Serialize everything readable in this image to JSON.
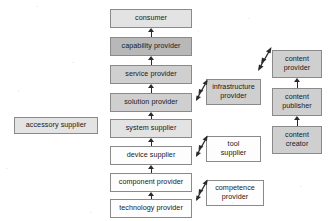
{
  "diagram": {
    "type": "block-flow-diagram",
    "colors": {
      "fill_dark": "#b8b8b8",
      "fill_mid": "#cfcfcf",
      "fill_light": "#e3e3e3",
      "fill_none": "#fdfdfd",
      "border": "#8a8a8a",
      "arrow": "#2b2b2b",
      "background": "#ffffff"
    },
    "main_chain": {
      "name": "main-value-chain",
      "direction": "bottom-to-top",
      "nodes": [
        {
          "id": "consumer",
          "label": "consumer",
          "shade": "light"
        },
        {
          "id": "capability-provider",
          "label": "capability provider",
          "shade": "dark"
        },
        {
          "id": "service-provider",
          "label": "service provider",
          "shade": "mid"
        },
        {
          "id": "solution-provider",
          "label": "solution provider",
          "shade": "mid"
        },
        {
          "id": "system-supplier",
          "label": "system supplier",
          "shade": "light"
        },
        {
          "id": "device-supplier",
          "label": "device supplier",
          "shade": "none"
        },
        {
          "id": "component-provider",
          "label": "component provider",
          "shade": "none"
        },
        {
          "id": "technology-provider",
          "label": "technology provider",
          "shade": "none"
        }
      ]
    },
    "content_chain": {
      "name": "content-value-chain",
      "direction": "bottom-to-top",
      "nodes": [
        {
          "id": "content-provider",
          "label": "content\nprovider",
          "shade": "mid"
        },
        {
          "id": "content-publisher",
          "label": "content\npublisher",
          "shade": "mid"
        },
        {
          "id": "content-creator",
          "label": "content\ncreator",
          "shade": "mid"
        }
      ]
    },
    "side_nodes": [
      {
        "id": "accessory-supplier",
        "label": "accessory supplier",
        "shade": "light"
      },
      {
        "id": "infrastructure-provider",
        "label": "infrastructure\nprovider",
        "shade": "mid"
      },
      {
        "id": "tool-supplier",
        "label": "tool\nsupplier",
        "shade": "none"
      },
      {
        "id": "competence-provider",
        "label": "competence\nprovider",
        "shade": "none"
      }
    ],
    "connectors": [
      {
        "id": "arrow-technology-to-component",
        "kind": "vertical-up"
      },
      {
        "id": "arrow-component-to-device",
        "kind": "vertical-up"
      },
      {
        "id": "arrow-device-to-system",
        "kind": "vertical-up"
      },
      {
        "id": "arrow-system-to-solution",
        "kind": "vertical-up"
      },
      {
        "id": "arrow-solution-to-service",
        "kind": "vertical-up"
      },
      {
        "id": "arrow-service-to-capability",
        "kind": "vertical-up"
      },
      {
        "id": "arrow-capability-to-consumer",
        "kind": "vertical-up"
      },
      {
        "id": "arrow-creator-to-publisher",
        "kind": "vertical-up"
      },
      {
        "id": "arrow-publisher-to-provider",
        "kind": "vertical-up"
      },
      {
        "id": "arrow-infrastructure-diagonal",
        "kind": "diagonal-double"
      },
      {
        "id": "arrow-tool-diagonal",
        "kind": "diagonal-double"
      },
      {
        "id": "arrow-competence-diagonal",
        "kind": "diagonal-double"
      },
      {
        "id": "arrow-content-diagonal",
        "kind": "diagonal-double"
      }
    ]
  }
}
